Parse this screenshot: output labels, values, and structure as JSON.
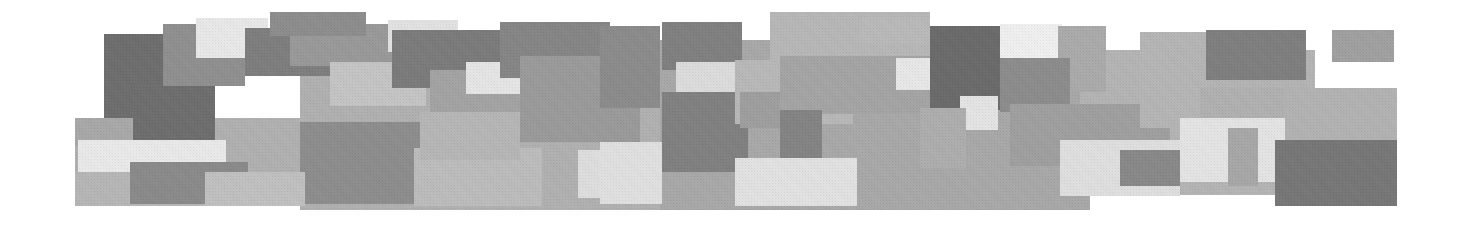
{
  "artwork": {
    "title": "Grayscale Rectangular Mosaic Banner",
    "description": "Abstract horizontal banner composed of overlapping opaque rectangles in shades of gray on a white background, with a scanned halftone texture.",
    "canvas": {
      "width": 1465,
      "height": 225,
      "background": "#ffffff"
    },
    "palette": {
      "white": "#ffffff",
      "near_white": "#f2f2f2",
      "very_light_gray": "#e6e6e6",
      "light_gray": "#d9d9d9",
      "light_mid_gray": "#c9c9c9",
      "mid_gray": "#b3b3b3",
      "mid_dark_gray": "#a6a6a6",
      "gray": "#999999",
      "dark_gray": "#8a8a8a",
      "darker_gray": "#7a7a7a",
      "very_dark_gray": "#6e6e6e",
      "charcoal": "#636363"
    },
    "tiles": [
      {
        "name": "tile-base-left-band",
        "x": 75,
        "y": 118,
        "w": 230,
        "h": 88,
        "color": "#b0b0b0"
      },
      {
        "name": "tile-base-mid-band",
        "x": 300,
        "y": 60,
        "w": 370,
        "h": 150,
        "color": "#b0b0b0"
      },
      {
        "name": "tile-base-right-band",
        "x": 660,
        "y": 40,
        "w": 430,
        "h": 170,
        "color": "#a8a8a8"
      },
      {
        "name": "tile-base-far-right-band",
        "x": 1080,
        "y": 50,
        "w": 235,
        "h": 145,
        "color": "#b4b4b4"
      },
      {
        "name": "tile-dark-upper-left",
        "x": 104,
        "y": 34,
        "w": 72,
        "h": 92,
        "color": "#6d6d6d"
      },
      {
        "name": "tile-gray-upper-left-2",
        "x": 163,
        "y": 24,
        "w": 82,
        "h": 62,
        "color": "#8f8f8f"
      },
      {
        "name": "tile-dark-left-lower",
        "x": 130,
        "y": 86,
        "w": 85,
        "h": 54,
        "color": "#6d6d6d"
      },
      {
        "name": "tile-gray-left-edge",
        "x": 75,
        "y": 118,
        "w": 58,
        "h": 28,
        "color": "#a8a8a8"
      },
      {
        "name": "tile-nearwhite-left",
        "x": 78,
        "y": 140,
        "w": 148,
        "h": 34,
        "color": "#eaeaea"
      },
      {
        "name": "tile-gray-left-bottom",
        "x": 75,
        "y": 172,
        "w": 130,
        "h": 34,
        "color": "#b6b6b6"
      },
      {
        "name": "tile-dark-left-bottom-blk",
        "x": 130,
        "y": 162,
        "w": 118,
        "h": 42,
        "color": "#8a8a8a"
      },
      {
        "name": "tile-lightest-top-1",
        "x": 196,
        "y": 18,
        "w": 72,
        "h": 40,
        "color": "#e9e9e9"
      },
      {
        "name": "tile-dark-top-2",
        "x": 245,
        "y": 28,
        "w": 112,
        "h": 48,
        "color": "#7d7d7d"
      },
      {
        "name": "tile-gray-top-3",
        "x": 290,
        "y": 24,
        "w": 142,
        "h": 42,
        "color": "#999999"
      },
      {
        "name": "tile-light-mid-1",
        "x": 330,
        "y": 62,
        "w": 96,
        "h": 44,
        "color": "#c4c4c4"
      },
      {
        "name": "tile-lightwhite-mid-1",
        "x": 388,
        "y": 20,
        "w": 70,
        "h": 32,
        "color": "#e2e2e2"
      },
      {
        "name": "tile-dark-mid-1",
        "x": 392,
        "y": 30,
        "w": 122,
        "h": 58,
        "color": "#7a7a7a"
      },
      {
        "name": "tile-gray-mid-2",
        "x": 430,
        "y": 70,
        "w": 140,
        "h": 48,
        "color": "#a3a3a3"
      },
      {
        "name": "tile-nearwhite-mid-2",
        "x": 466,
        "y": 62,
        "w": 62,
        "h": 32,
        "color": "#e6e6e6"
      },
      {
        "name": "tile-dark-mid-2",
        "x": 500,
        "y": 22,
        "w": 110,
        "h": 56,
        "color": "#858585"
      },
      {
        "name": "tile-mid-block-big",
        "x": 520,
        "y": 56,
        "w": 120,
        "h": 86,
        "color": "#9a9a9a"
      },
      {
        "name": "tile-dark-low-1",
        "x": 300,
        "y": 122,
        "w": 125,
        "h": 82,
        "color": "#8d8d8d"
      },
      {
        "name": "tile-light-low-1",
        "x": 414,
        "y": 148,
        "w": 128,
        "h": 58,
        "color": "#bcbcbc"
      },
      {
        "name": "tile-nearwhite-low-1",
        "x": 578,
        "y": 150,
        "w": 82,
        "h": 48,
        "color": "#dedede"
      },
      {
        "name": "tile-dark-top-4",
        "x": 600,
        "y": 26,
        "w": 60,
        "h": 82,
        "color": "#8b8b8b"
      },
      {
        "name": "tile-gray-top-5",
        "x": 662,
        "y": 22,
        "w": 80,
        "h": 48,
        "color": "#7f7f7f"
      },
      {
        "name": "tile-nearwhite-top-2",
        "x": 676,
        "y": 62,
        "w": 76,
        "h": 34,
        "color": "#dcdcdc"
      },
      {
        "name": "tile-dark-center-big",
        "x": 662,
        "y": 92,
        "w": 86,
        "h": 80,
        "color": "#808080"
      },
      {
        "name": "tile-light-center-1",
        "x": 600,
        "y": 142,
        "w": 62,
        "h": 62,
        "color": "#e0e0e0"
      },
      {
        "name": "tile-gray-center-2",
        "x": 735,
        "y": 60,
        "w": 118,
        "h": 64,
        "color": "#b8b8b8"
      },
      {
        "name": "tile-midgray-center-3",
        "x": 740,
        "y": 92,
        "w": 56,
        "h": 36,
        "color": "#9e9e9e"
      },
      {
        "name": "tile-nearwhite-center-big",
        "x": 735,
        "y": 158,
        "w": 122,
        "h": 48,
        "color": "#e2e2e2"
      },
      {
        "name": "tile-gray-r-band-1",
        "x": 770,
        "y": 12,
        "w": 160,
        "h": 50,
        "color": "#b7b7b7"
      },
      {
        "name": "tile-gray-r-band-2",
        "x": 780,
        "y": 56,
        "w": 150,
        "h": 58,
        "color": "#a4a4a4"
      },
      {
        "name": "tile-dark-r-1",
        "x": 780,
        "y": 110,
        "w": 42,
        "h": 48,
        "color": "#838383"
      },
      {
        "name": "tile-nearwhite-r-1",
        "x": 896,
        "y": 58,
        "w": 72,
        "h": 32,
        "color": "#e8e8e8"
      },
      {
        "name": "tile-charcoal-r-1",
        "x": 930,
        "y": 26,
        "w": 102,
        "h": 84,
        "color": "#6a6a6a"
      },
      {
        "name": "tile-white-r-1",
        "x": 1000,
        "y": 24,
        "w": 62,
        "h": 36,
        "color": "#f0f0f0"
      },
      {
        "name": "tile-gray-r-3",
        "x": 1058,
        "y": 26,
        "w": 48,
        "h": 66,
        "color": "#aaaaaa"
      },
      {
        "name": "tile-dark-r-2",
        "x": 1000,
        "y": 58,
        "w": 70,
        "h": 54,
        "color": "#8c8c8c"
      },
      {
        "name": "tile-light-r-2",
        "x": 960,
        "y": 96,
        "w": 38,
        "h": 34,
        "color": "#e4e4e4"
      },
      {
        "name": "tile-gray-r-4",
        "x": 920,
        "y": 108,
        "w": 46,
        "h": 60,
        "color": "#adadad"
      },
      {
        "name": "tile-mid-r-big",
        "x": 1010,
        "y": 104,
        "w": 160,
        "h": 62,
        "color": "#9f9f9f"
      },
      {
        "name": "tile-nearwhite-r-3",
        "x": 1060,
        "y": 140,
        "w": 120,
        "h": 56,
        "color": "#dfdfdf"
      },
      {
        "name": "tile-dark-r-3",
        "x": 1120,
        "y": 150,
        "w": 60,
        "h": 36,
        "color": "#888888"
      },
      {
        "name": "tile-gray-rr-1",
        "x": 1140,
        "y": 32,
        "w": 68,
        "h": 96,
        "color": "#b5b5b5"
      },
      {
        "name": "tile-dark-rr-1",
        "x": 1206,
        "y": 30,
        "w": 100,
        "h": 50,
        "color": "#7e7e7e"
      },
      {
        "name": "tile-gray-rr-2",
        "x": 1200,
        "y": 88,
        "w": 122,
        "h": 40,
        "color": "#b0b0b0"
      },
      {
        "name": "tile-nearwhite-rr-1",
        "x": 1180,
        "y": 118,
        "w": 105,
        "h": 64,
        "color": "#e4e4e4"
      },
      {
        "name": "tile-gray-rr-3",
        "x": 1228,
        "y": 128,
        "w": 30,
        "h": 58,
        "color": "#a7a7a7"
      },
      {
        "name": "tile-dark-rr-small",
        "x": 1332,
        "y": 30,
        "w": 62,
        "h": 32,
        "color": "#a0a0a0"
      },
      {
        "name": "tile-gray-rr-4",
        "x": 1285,
        "y": 88,
        "w": 112,
        "h": 52,
        "color": "#b2b2b2"
      },
      {
        "name": "tile-charcoal-rr-corner",
        "x": 1275,
        "y": 140,
        "w": 122,
        "h": 66,
        "color": "#767676"
      },
      {
        "name": "tile-bottom-fill-left",
        "x": 205,
        "y": 172,
        "w": 100,
        "h": 34,
        "color": "#c0c0c0"
      },
      {
        "name": "tile-bottom-fill-mid",
        "x": 420,
        "y": 112,
        "w": 100,
        "h": 48,
        "color": "#b6b6b6"
      },
      {
        "name": "tile-top-cap-1",
        "x": 270,
        "y": 12,
        "w": 96,
        "h": 24,
        "color": "#8d8d8d"
      },
      {
        "name": "tile-top-cap-2",
        "x": 860,
        "y": 18,
        "w": 70,
        "h": 26,
        "color": "#b9b9b9"
      }
    ]
  }
}
